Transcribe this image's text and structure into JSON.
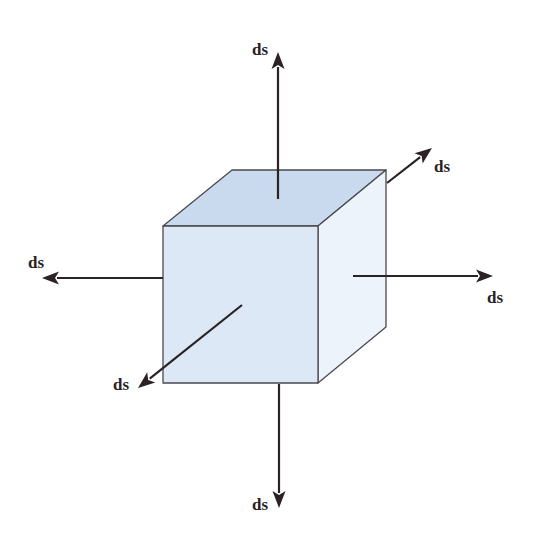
{
  "diagram": {
    "type": "cube-with-surface-vectors",
    "cube": {
      "faces": {
        "top": {
          "points": "163,226 232,170 386,170 318,226",
          "color": "#c9d9ee"
        },
        "front": {
          "points": "163,226 318,226 318,383 163,383",
          "color": "#dce8f5"
        },
        "right": {
          "points": "318,226 386,170 386,327 318,383",
          "color": "#edf3fa"
        }
      },
      "edge_color": "#4a4a4f"
    },
    "arrow_color": "#2a2224",
    "arrows": [
      {
        "name": "top",
        "from": [
          278,
          199
        ],
        "to": [
          278,
          52
        ],
        "label": "ds",
        "label_pos": [
          252,
          55
        ]
      },
      {
        "name": "back-right",
        "from": [
          387,
          183
        ],
        "to": [
          432,
          148
        ],
        "label": "ds",
        "label_pos": [
          434,
          172
        ]
      },
      {
        "name": "left",
        "from": [
          163,
          278
        ],
        "to": [
          42,
          278
        ],
        "label": "ds",
        "label_pos": [
          28,
          268
        ]
      },
      {
        "name": "right",
        "from": [
          353,
          276
        ],
        "to": [
          493,
          276
        ],
        "label": "ds",
        "label_pos": [
          487,
          303
        ]
      },
      {
        "name": "front-left",
        "from": [
          242,
          305
        ],
        "to": [
          138,
          388
        ],
        "label": "ds",
        "label_pos": [
          113,
          390
        ]
      },
      {
        "name": "bottom",
        "from": [
          279,
          384
        ],
        "to": [
          279,
          508
        ],
        "label": "ds",
        "label_pos": [
          252,
          510
        ]
      }
    ]
  }
}
